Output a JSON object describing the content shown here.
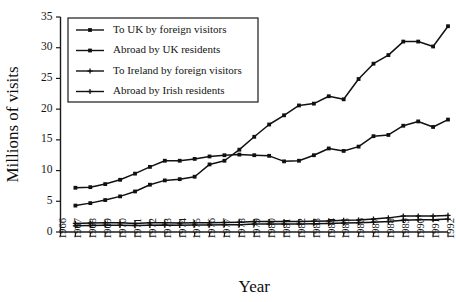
{
  "chart_data": {
    "type": "line",
    "title": "",
    "xlabel": "Year",
    "ylabel": "Millions of visits",
    "grid": false,
    "legend_position": "top-left",
    "xlim": [
      1966,
      1992
    ],
    "ylim": [
      0,
      35
    ],
    "yticks": [
      0,
      5,
      10,
      15,
      20,
      25,
      30,
      35
    ],
    "x": [
      1966,
      1967,
      1968,
      1969,
      1970,
      1971,
      1972,
      1973,
      1974,
      1975,
      1976,
      1977,
      1978,
      1979,
      1980,
      1981,
      1982,
      1983,
      1984,
      1985,
      1986,
      1987,
      1988,
      1989,
      1990,
      1991,
      1992
    ],
    "xtick_labels": [
      "1966",
      "1967",
      "1968",
      "1969",
      "1970",
      "1971",
      "1972",
      "1973",
      "1974",
      "1975",
      "1976",
      "1977",
      "1978",
      "1979",
      "1980",
      "1981",
      "1982",
      "1983",
      "1984",
      "1985",
      "1986",
      "1987",
      "1988",
      "1989",
      "1990",
      "1991",
      "1992"
    ],
    "series": [
      {
        "name": "To UK by foreign visitors",
        "marker": "square",
        "values": [
          null,
          7.2,
          7.3,
          7.8,
          8.5,
          9.5,
          10.6,
          11.6,
          11.6,
          11.9,
          12.3,
          12.5,
          12.6,
          12.5,
          12.4,
          11.5,
          11.6,
          12.5,
          13.6,
          13.2,
          13.9,
          15.6,
          15.8,
          17.3,
          18.0,
          17.1,
          18.3
        ]
      },
      {
        "name": "Abroad by UK residents",
        "marker": "square",
        "values": [
          null,
          4.3,
          4.7,
          5.2,
          5.8,
          6.6,
          7.7,
          8.4,
          8.6,
          9.0,
          11.0,
          11.6,
          13.4,
          15.5,
          17.5,
          19.0,
          20.6,
          20.9,
          22.1,
          21.6,
          24.9,
          27.4,
          28.8,
          31.0,
          31.0,
          30.2,
          33.5
        ]
      },
      {
        "name": "To Ireland by foreign visitors",
        "marker": "plus",
        "values": [
          null,
          1.4,
          1.45,
          1.5,
          1.5,
          1.4,
          1.5,
          1.5,
          1.45,
          1.5,
          1.5,
          1.55,
          1.6,
          1.7,
          1.7,
          1.7,
          1.7,
          1.75,
          1.8,
          1.9,
          1.95,
          2.1,
          2.3,
          2.6,
          2.6,
          2.6,
          2.7
        ]
      },
      {
        "name": "Abroad by Irish residents",
        "marker": "plus",
        "values": [
          null,
          1.0,
          1.05,
          1.1,
          1.1,
          1.05,
          1.1,
          1.15,
          1.1,
          1.15,
          1.15,
          1.2,
          1.2,
          1.3,
          1.3,
          1.3,
          1.3,
          1.35,
          1.4,
          1.45,
          1.5,
          1.6,
          1.7,
          1.9,
          2.0,
          2.0,
          2.1
        ]
      }
    ]
  },
  "colors": {
    "ink": "#111111",
    "background": "#ffffff"
  }
}
